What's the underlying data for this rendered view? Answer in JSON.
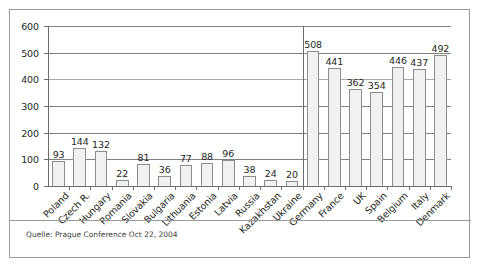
{
  "figure": {
    "source_note": "Quelle: Prague Conference Oct 22, 2004"
  },
  "chart_data": {
    "type": "bar",
    "title": "",
    "subtitle": "",
    "xlabel": "",
    "ylabel": "",
    "ylim": [
      0,
      600
    ],
    "ytick_labels": [
      "0",
      "100",
      "200",
      "300",
      "400",
      "500",
      "600"
    ],
    "yticks": [
      0,
      100,
      200,
      300,
      400,
      500,
      600
    ],
    "grid": "horizontal",
    "legend": "none",
    "group_separator_after_category": "Ukraine",
    "categories": [
      "Poland",
      "Czech R.",
      "Hungary",
      "Romania",
      "Slovakia",
      "Bulgaria",
      "Lithuania",
      "Estonia",
      "Latvia",
      "Russia",
      "Kazakhstan",
      "Ukraine",
      "Germany",
      "France",
      "UK",
      "Spain",
      "Belgium",
      "Italy",
      "Denmark"
    ],
    "values": [
      93,
      144,
      132,
      22,
      81,
      36,
      77,
      88,
      96,
      38,
      24,
      20,
      508,
      441,
      362,
      354,
      446,
      437,
      492
    ],
    "value_labels": [
      "93",
      "144",
      "132",
      "22",
      "81",
      "36",
      "77",
      "88",
      "96",
      "38",
      "24",
      "20",
      "508",
      "441",
      "362",
      "354",
      "446",
      "437",
      "492"
    ],
    "bar_fill_color": "#f1f1f1",
    "bar_edge_color": "#8c8c8c",
    "grid_color": "#808080",
    "axis_color": "#6e6e6e",
    "text_color": "#231f20"
  }
}
